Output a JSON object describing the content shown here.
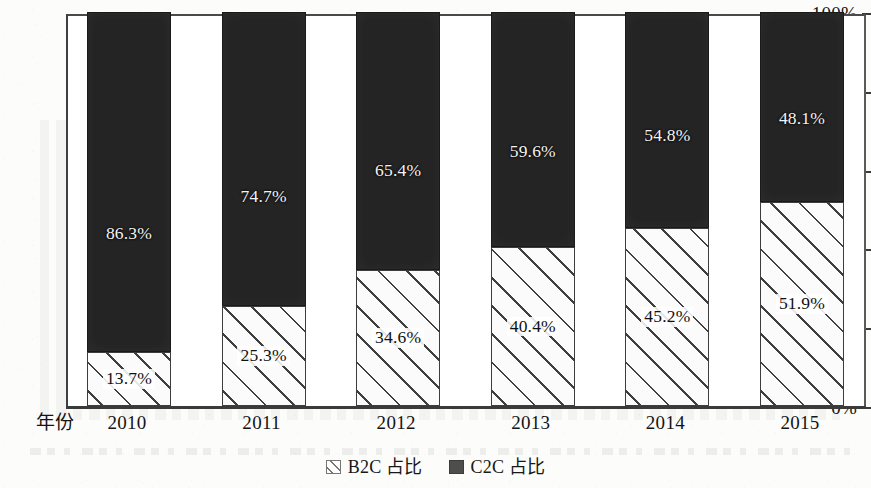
{
  "chart_data": {
    "type": "bar",
    "subtype": "stacked-100-percent",
    "title": "",
    "xlabel": "年份",
    "ylabel": "",
    "categories": [
      "2010",
      "2011",
      "2012",
      "2013",
      "2014",
      "2015"
    ],
    "series": [
      {
        "name": "B2C 占比",
        "fill": "diagonal-hatch",
        "values": [
          13.7,
          25.3,
          34.6,
          40.4,
          45.2,
          51.9
        ],
        "labels": [
          "13.7%",
          "25.3%",
          "34.6%",
          "40.4%",
          "45.2%",
          "51.9%"
        ]
      },
      {
        "name": "C2C 占比",
        "fill": "solid-dark",
        "values": [
          86.3,
          74.7,
          65.4,
          59.6,
          54.8,
          48.1
        ],
        "labels": [
          "86.3%",
          "74.7%",
          "65.4%",
          "59.6%",
          "54.8%",
          "48.1%"
        ]
      }
    ],
    "ylim": [
      0,
      100
    ],
    "ytick_values": [
      0,
      20,
      40,
      60,
      80,
      100
    ],
    "ytick_labels": [
      "0%",
      "20%",
      "40%",
      "60%",
      "80%",
      "100%"
    ],
    "grid": false,
    "legend_position": "bottom-center",
    "colors": {
      "series_c2c": "#242424",
      "series_b2c_line": "#3f3f3f",
      "series_b2c_fill": "#fbfbfb",
      "axis": "#3a3a3a",
      "text": "#141414",
      "background": "#fcfcfb"
    }
  },
  "legend": {
    "items": [
      {
        "label": "B2C 占比",
        "swatch": "hatch-swatch-icon"
      },
      {
        "label": "C2C 占比",
        "swatch": "solid-swatch-icon"
      }
    ]
  }
}
